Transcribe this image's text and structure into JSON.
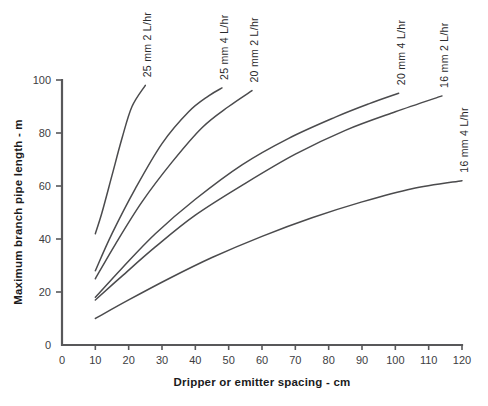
{
  "chart_data": {
    "type": "line",
    "title": "",
    "xlabel": "Dripper or emitter spacing - cm",
    "ylabel": "Maximum branch pipe length - m",
    "xlim": [
      0,
      120
    ],
    "ylim": [
      0,
      100
    ],
    "xticks": [
      0,
      10,
      20,
      30,
      40,
      50,
      60,
      70,
      80,
      90,
      100,
      110,
      120
    ],
    "yticks": [
      0,
      20,
      40,
      60,
      80,
      100
    ],
    "xtick_labels": [
      "0",
      "10",
      "20",
      "30",
      "40",
      "50",
      "60",
      "70",
      "80",
      "90",
      "100",
      "110",
      "120"
    ],
    "ytick_labels": [
      "0",
      "20",
      "40",
      "60",
      "80",
      "100"
    ],
    "grid": false,
    "legend_position": "inline-curve-end-labels",
    "series": [
      {
        "name": "25 mm  2 L/hr",
        "pipe_diameter_mm": 25,
        "emitter_flow_l_per_hr": 2,
        "label_x": 25,
        "x": [
          10,
          12,
          15,
          18,
          21,
          25
        ],
        "y": [
          42,
          50,
          64,
          78,
          90,
          98
        ]
      },
      {
        "name": "25 mm  4 L/hr",
        "pipe_diameter_mm": 25,
        "emitter_flow_l_per_hr": 4,
        "label_x": 48,
        "x": [
          10,
          15,
          22,
          30,
          38,
          44,
          48
        ],
        "y": [
          28,
          42,
          59,
          76,
          88,
          94,
          97
        ]
      },
      {
        "name": "20 mm  2 L/hr",
        "pipe_diameter_mm": 20,
        "emitter_flow_l_per_hr": 2,
        "label_x": 57,
        "x": [
          10,
          16,
          24,
          33,
          42,
          50,
          57
        ],
        "y": [
          25,
          38,
          54,
          69,
          82,
          90,
          96
        ]
      },
      {
        "name": "20 mm  4 L/hr",
        "pipe_diameter_mm": 20,
        "emitter_flow_l_per_hr": 4,
        "label_x": 101,
        "x": [
          10,
          18,
          28,
          40,
          54,
          68,
          82,
          92,
          101
        ],
        "y": [
          18,
          29,
          42,
          55,
          68,
          78,
          86,
          91,
          95
        ]
      },
      {
        "name": "16 mm  2 L/hr",
        "pipe_diameter_mm": 16,
        "emitter_flow_l_per_hr": 2,
        "label_x": 114,
        "x": [
          10,
          18,
          28,
          40,
          55,
          70,
          85,
          100,
          114
        ],
        "y": [
          17,
          26,
          37,
          49,
          61,
          72,
          81,
          88,
          94
        ]
      },
      {
        "name": "16 mm  4 L/hr",
        "pipe_diameter_mm": 16,
        "emitter_flow_l_per_hr": 4,
        "label_x": 120,
        "x": [
          10,
          20,
          32,
          45,
          60,
          75,
          90,
          105,
          120
        ],
        "y": [
          10,
          17,
          25,
          33,
          41,
          48,
          54,
          59,
          62
        ]
      }
    ]
  }
}
